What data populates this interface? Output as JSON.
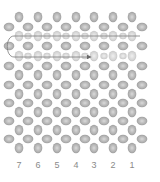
{
  "diagram": {
    "title": "",
    "bead_color_edge": "#9a9a9a",
    "bead_color_center": "#d8d8d8",
    "faded_color_edge": "#c4c4c4",
    "faded_color_center": "#eeeeee",
    "thread_color": "#7a7a7a",
    "columns_x": [
      19,
      38,
      57,
      76,
      94,
      113,
      132
    ],
    "offset_columns_x": [
      9,
      28,
      47,
      66,
      85,
      104,
      123,
      142
    ],
    "rows_y": [
      17,
      27,
      36,
      46,
      56,
      66,
      75,
      85,
      94,
      103,
      112,
      121,
      130,
      139,
      148
    ],
    "highlighted_rows": [
      2,
      4
    ],
    "thread_path": {
      "start": [
        140,
        36
      ],
      "left_x": 14,
      "end_row_y": 57,
      "arrow_x": 90
    },
    "column_labels": [
      {
        "label": "7",
        "x": 19
      },
      {
        "label": "6",
        "x": 38
      },
      {
        "label": "5",
        "x": 57
      },
      {
        "label": "4",
        "x": 76
      },
      {
        "label": "3",
        "x": 94
      },
      {
        "label": "2",
        "x": 113
      },
      {
        "label": "1",
        "x": 132
      }
    ]
  }
}
